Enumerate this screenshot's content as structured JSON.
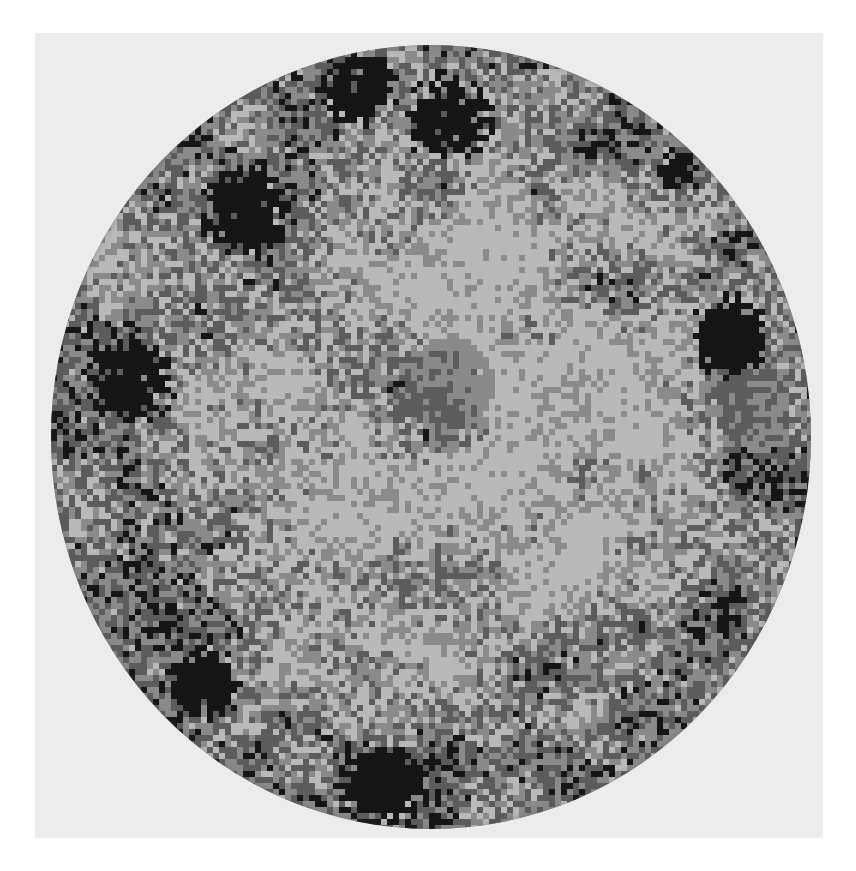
{
  "image": {
    "kind": "grayscale circular texture map",
    "canvas": {
      "width": 856,
      "height": 871,
      "background": "#ffffff"
    },
    "panel": {
      "x": 35,
      "y": 33,
      "width": 788,
      "height": 805,
      "color": "#ececec"
    },
    "disc": {
      "x": 51,
      "y": 45,
      "width": 760,
      "height": 784
    },
    "palette": {
      "light": "#b9b9b9",
      "mid": "#8a8a8a",
      "dark": "#5c5c5c",
      "black": "#151515"
    },
    "cell_size": 6,
    "regions": {
      "center_light_ring_radius": 0.55,
      "center_dark_patch": {
        "cx": 0.5,
        "cy": 0.47,
        "r": 0.09
      },
      "outer_ring_darker": true
    },
    "dark_blotches": [
      {
        "name": "top-center-left",
        "cx": 0.4,
        "cy": 0.05,
        "r": 0.045
      },
      {
        "name": "top-center-right",
        "cx": 0.52,
        "cy": 0.09,
        "r": 0.05
      },
      {
        "name": "upper-left",
        "cx": 0.25,
        "cy": 0.21,
        "r": 0.05
      },
      {
        "name": "right-edge",
        "cx": 0.89,
        "cy": 0.37,
        "r": 0.045
      },
      {
        "name": "left-edge",
        "cx": 0.1,
        "cy": 0.42,
        "r": 0.05
      },
      {
        "name": "lower-left",
        "cx": 0.2,
        "cy": 0.81,
        "r": 0.04
      },
      {
        "name": "bottom-center",
        "cx": 0.43,
        "cy": 0.94,
        "r": 0.05
      },
      {
        "name": "upper-right",
        "cx": 0.82,
        "cy": 0.16,
        "r": 0.025
      }
    ],
    "mid_patches": [
      {
        "name": "right-mid-gray-block",
        "cx": 0.92,
        "cy": 0.46,
        "r": 0.05
      },
      {
        "name": "center-block",
        "cx": 0.52,
        "cy": 0.43,
        "r": 0.06
      }
    ]
  }
}
